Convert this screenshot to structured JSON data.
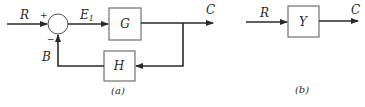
{
  "diagram_a": {
    "caption": "(a)",
    "input_label": "R",
    "plus_sign": "+",
    "minus_sign": "−",
    "error_label": "E",
    "error_subscript": "1",
    "forward_block": "G",
    "feedback_block": "H",
    "feedback_signal": "B",
    "output_label": "C"
  },
  "diagram_b": {
    "caption": "(b)",
    "input_label": "R",
    "block": "Y",
    "output_label": "C"
  }
}
